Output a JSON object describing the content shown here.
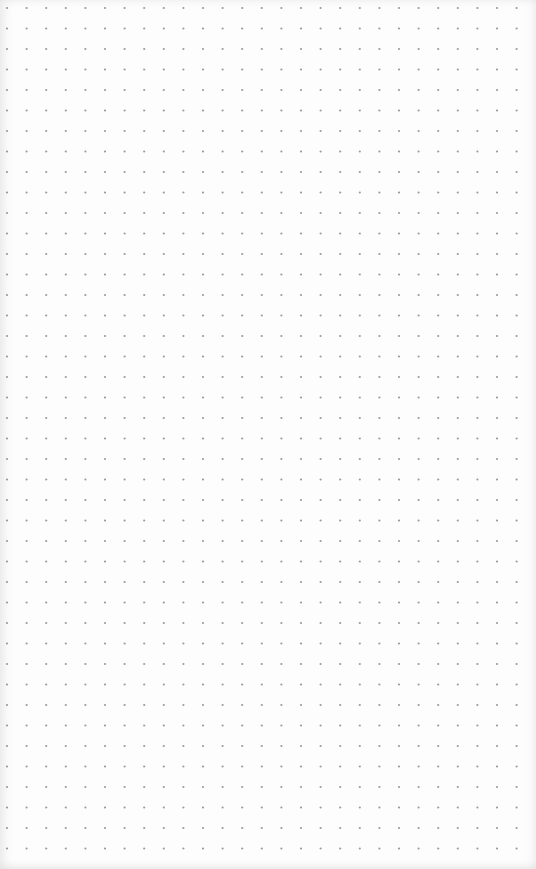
{
  "page": {
    "type": "dot-grid-paper",
    "background_color": "#fdfdfd",
    "dot_color": "#9a9a9a",
    "dot_radius": 1.1
  },
  "grid": {
    "columns": 27,
    "rows": 42,
    "origin_x": 7,
    "origin_y": 8,
    "pitch_x": 19.6,
    "pitch_y": 20.5
  }
}
